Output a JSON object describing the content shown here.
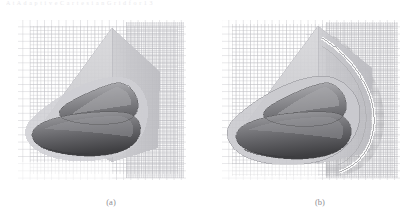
{
  "figure": {
    "top_running_text": "A  t      A d a p t i v e   C a r t e s i a n   G r i d      f o r         1 3",
    "background_color": "#ffffff",
    "panels": [
      {
        "id": "a",
        "caption": "(a)",
        "description": "Cartesian volume mesh around blunt forebody with canopy, uniform outer refinement",
        "mesh_line_color": "#b9b9bd",
        "mesh_dense_color": "#a6a6ab",
        "symmetry_plane_color": "#cfcfd2",
        "body_surface_color": "#6f6f72",
        "body_highlight_color": "#9d9da1",
        "body_shadow_color": "#4a4a4d",
        "shock_line_color": "#8b8b8f",
        "grid_cols": 26,
        "grid_rows": 24,
        "refinement_levels": 2,
        "shock_visible": false
      },
      {
        "id": "b",
        "caption": "(b)",
        "description": "Solution adapted Cartesian mesh; refinement clustered along bow shock envelope",
        "mesh_line_color": "#b9b9bd",
        "mesh_dense_color": "#9b9ba0",
        "symmetry_plane_color": "#cfcfd2",
        "body_surface_color": "#6f6f72",
        "body_highlight_color": "#9d9da1",
        "body_shadow_color": "#4a4a4d",
        "shock_line_color": "#7c7c80",
        "grid_cols": 30,
        "grid_rows": 26,
        "refinement_levels": 3,
        "shock_visible": true
      }
    ]
  }
}
